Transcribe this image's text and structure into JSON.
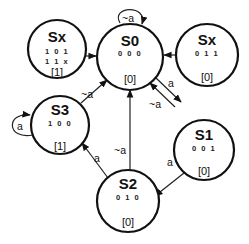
{
  "diagram": {
    "type": "finite-state-machine",
    "states": [
      {
        "id": "sx_left",
        "name": "Sx",
        "codes": [
          "1 0 1",
          "1 1 x"
        ],
        "output": "[1]",
        "cx": 57,
        "cy": 49,
        "r": 29
      },
      {
        "id": "s0",
        "name": "S0",
        "codes": [
          "0 0 0"
        ],
        "output": "[0]",
        "cx": 130,
        "cy": 55,
        "r": 33
      },
      {
        "id": "sx_right",
        "name": "Sx",
        "codes": [
          "0 1 1"
        ],
        "output": "[0]",
        "cx": 207,
        "cy": 53,
        "r": 31
      },
      {
        "id": "s3",
        "name": "S3",
        "codes": [
          "1 0 0"
        ],
        "output": "[1]",
        "cx": 60,
        "cy": 123,
        "r": 29
      },
      {
        "id": "s1",
        "name": "S1",
        "codes": [
          "0 0 1"
        ],
        "output": "[0]",
        "cx": 204,
        "cy": 150,
        "r": 30
      },
      {
        "id": "s2",
        "name": "S2",
        "codes": [
          "0 1 0"
        ],
        "output": "[0]",
        "cx": 128,
        "cy": 201,
        "r": 31
      }
    ],
    "transitions": [
      {
        "from": "sx_left",
        "to": "s0",
        "label": ""
      },
      {
        "from": "sx_right",
        "to": "s0",
        "label": ""
      },
      {
        "from": "s0",
        "to": "s0",
        "label": "~a"
      },
      {
        "from": "s0",
        "to": "s1",
        "label": "a"
      },
      {
        "from": "s1",
        "to": "s0",
        "label": "~a"
      },
      {
        "from": "s1",
        "to": "s2",
        "label": "a"
      },
      {
        "from": "s2",
        "to": "s0",
        "label": "~a"
      },
      {
        "from": "s2",
        "to": "s3",
        "label": "a"
      },
      {
        "from": "s3",
        "to": "s0",
        "label": "~a"
      },
      {
        "from": "s3",
        "to": "s3",
        "label": "a"
      }
    ]
  },
  "labels": {
    "s0_self": "~a",
    "s0_to_s1": "a",
    "s1_to_s0": "~a",
    "s1_to_s2": "a",
    "s2_to_s0": "~a",
    "s2_to_s3": "a",
    "s3_to_s0": "~a",
    "s3_self": "a"
  },
  "colors": {
    "stroke": "#111111",
    "background": "#ffffff"
  }
}
